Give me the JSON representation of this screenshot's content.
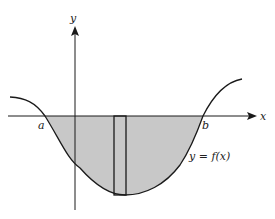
{
  "figure": {
    "type": "definite integral region diagram",
    "axes": {
      "x_label": "x",
      "y_label": "y"
    },
    "points": {
      "a_label": "a",
      "b_label": "b"
    },
    "curve_label": "y = f(x)",
    "shading": {
      "description": "region between curve and x-axis from a to b, lying below x-axis",
      "fill_color": "#c8c8c8"
    },
    "strip": {
      "description": "representative vertical rectangle strip"
    },
    "colors": {
      "line": "#1a1a1a",
      "background": "#ffffff"
    }
  }
}
